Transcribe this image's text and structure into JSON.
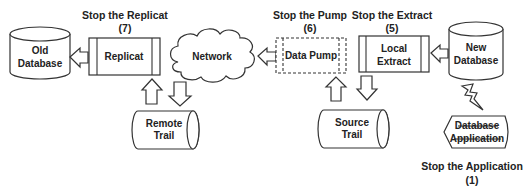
{
  "diagram": {
    "title": "",
    "nodes": {
      "old_database": {
        "line1": "Old",
        "line2": "Database"
      },
      "replicat": {
        "label": "Replicat",
        "stop_label": "Stop the Replicat",
        "step": "(7)"
      },
      "network": {
        "label": "Network"
      },
      "data_pump": {
        "label": "Data Pump",
        "stop_label": "Stop the Pump",
        "step": "(6)"
      },
      "local_extract": {
        "line1": "Local",
        "line2": "Extract",
        "stop_label": "Stop the Extract",
        "step": "(5)"
      },
      "new_database": {
        "line1": "New",
        "line2": "Database"
      },
      "remote_trail": {
        "line1": "Remote",
        "line2": "Trail"
      },
      "source_trail": {
        "line1": "Source",
        "line2": "Trail"
      },
      "database_application": {
        "line1": "Database",
        "line2": "Application",
        "struck_through": true,
        "stop_label": "Stop the Application",
        "step": "(1)"
      }
    },
    "edges": [
      {
        "from": "new_database",
        "to": "local_extract",
        "direction": "left"
      },
      {
        "from": "local_extract",
        "to": "source_trail",
        "direction": "down"
      },
      {
        "from": "source_trail",
        "to": "data_pump",
        "direction": "up"
      },
      {
        "from": "data_pump",
        "to": "network",
        "direction": "left"
      },
      {
        "from": "network",
        "to": "remote_trail",
        "direction": "down"
      },
      {
        "from": "remote_trail",
        "to": "replicat",
        "direction": "up"
      },
      {
        "from": "replicat",
        "to": "old_database",
        "direction": "left"
      },
      {
        "from": "database_application",
        "to": "new_database",
        "type": "lightning"
      }
    ]
  }
}
